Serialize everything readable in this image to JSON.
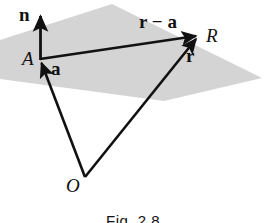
{
  "figure": {
    "caption": "Fig. 2.8",
    "background_color": "#ffffff",
    "ink_color": "#111111",
    "plane_fill_color": "#d4d4d4"
  },
  "labels": {
    "normal_vector": "n",
    "position_vector_a": "a",
    "difference_vector": "r − a",
    "position_vector_r": "r",
    "point_A": "A",
    "point_R": "R",
    "point_O": "O"
  },
  "diagram_data": {
    "type": "geometry",
    "description": "Plane through point A with normal vector n; position vectors a and r from origin O to points A and R, and the difference vector r minus a lying in the plane.",
    "points": {
      "A": {
        "x": 40,
        "y": 59
      },
      "R": {
        "x": 199,
        "y": 34
      },
      "O": {
        "x": 85,
        "y": 177
      },
      "n_tip": {
        "x": 41,
        "y": 11
      }
    },
    "plane_polygon": [
      {
        "x": 0,
        "y": 40
      },
      {
        "x": 112,
        "y": 4
      },
      {
        "x": 262,
        "y": 78
      },
      {
        "x": 164,
        "y": 101
      },
      {
        "x": 0,
        "y": 79
      }
    ],
    "vectors": [
      {
        "name": "n",
        "from": "A",
        "to": "n_tip",
        "label": "n",
        "arrow": true
      },
      {
        "name": "a",
        "from": "O",
        "to": "A",
        "label": "a",
        "arrow": true
      },
      {
        "name": "r",
        "from": "O",
        "to": "R",
        "label": "r",
        "arrow": true
      },
      {
        "name": "r-minus-a",
        "from": "A",
        "to": "R",
        "label": "r − a",
        "arrow": true
      }
    ]
  }
}
